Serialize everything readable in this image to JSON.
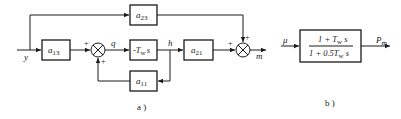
{
  "diagram_a": {
    "caption": "a )",
    "input_label": "y",
    "output_label": "m",
    "signal_q": "q",
    "signal_h": "h",
    "blocks": {
      "a23": {
        "main": "a",
        "sub": "23"
      },
      "a13": {
        "main": "a",
        "sub": "13"
      },
      "tws": {
        "text": "-T",
        "sub": "w",
        "tail": "s"
      },
      "a21": {
        "main": "a",
        "sub": "21"
      },
      "a11": {
        "main": "a",
        "sub": "11"
      }
    },
    "summer1_signs": {
      "left": "+",
      "bottom": "+"
    },
    "summer2_signs": {
      "left": "+",
      "top": "+"
    }
  },
  "diagram_b": {
    "caption": "b )",
    "input_label": "μ",
    "output_label": "P",
    "output_sub": "m",
    "numerator": {
      "pre": "1 + T",
      "sub": "w",
      "post": " s"
    },
    "denominator": {
      "pre": "1 + 0.5T",
      "sub": "w",
      "post": " s"
    }
  }
}
